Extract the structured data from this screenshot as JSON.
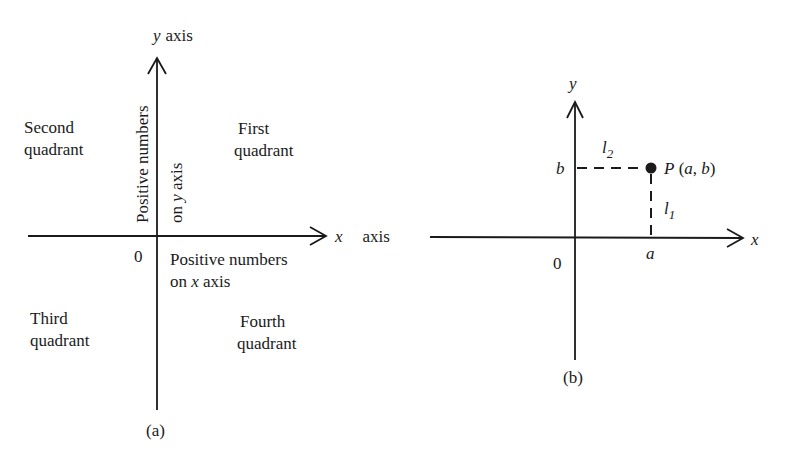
{
  "figure_a": {
    "caption": "(a)",
    "y_axis_label_var": "y",
    "y_axis_label_word": "axis",
    "x_axis_label_var": "x",
    "x_axis_label_word": "axis",
    "origin": "0",
    "quadrants": {
      "first": [
        "First",
        "quadrant"
      ],
      "second": [
        "Second",
        "quadrant"
      ],
      "third": [
        "Third",
        "quadrant"
      ],
      "fourth": [
        "Fourth",
        "quadrant"
      ]
    },
    "positive_y": {
      "line1": "Positive numbers",
      "line2_pre": "on ",
      "line2_var": "y",
      "line2_post": " axis"
    },
    "positive_x": {
      "line1": "Positive numbers",
      "line2_pre": "on ",
      "line2_var": "x",
      "line2_post": " axis"
    }
  },
  "figure_b": {
    "caption": "(b)",
    "y_axis_label": "y",
    "x_axis_label": "x",
    "origin": "0",
    "tick_x": "a",
    "tick_y": "b",
    "point_name": "P",
    "point_coords_open": " (",
    "point_a": "a",
    "point_sep": ", ",
    "point_b": "b",
    "point_coords_close": ")",
    "l1_base": "l",
    "l1_sub": "1",
    "l2_base": "l",
    "l2_sub": "2"
  },
  "colors": {
    "ink": "#1a1a1a",
    "background": "#ffffff"
  }
}
